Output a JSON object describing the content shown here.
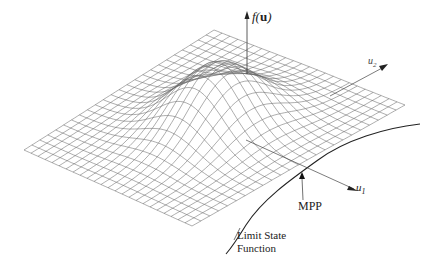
{
  "figure": {
    "type": "3d-surface-diagram",
    "labels": {
      "vertical_axis": "f(u)",
      "vertical_axis_func": "f(",
      "vertical_axis_var": "u",
      "vertical_axis_close": ")",
      "axis_u1": "u",
      "axis_u1_sub": "1",
      "axis_u2": "u",
      "axis_u2_sub": "2",
      "mpp": "MPP",
      "limit_state_line1": "Limit State",
      "limit_state_line2": "Function"
    },
    "mesh": {
      "grid_divisions": 24,
      "line_color": "#555555",
      "peak_height": 62
    },
    "colors": {
      "background": "#ffffff",
      "lines": "#333333",
      "mesh": "#666666"
    }
  }
}
